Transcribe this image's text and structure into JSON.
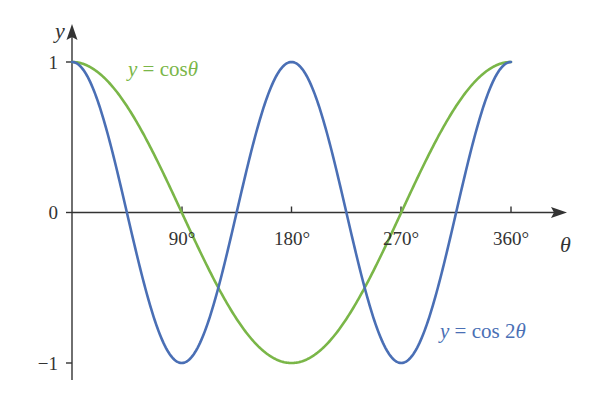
{
  "chart_data": {
    "type": "line",
    "title": "",
    "xlabel": "θ",
    "ylabel": "y",
    "xlim": [
      0,
      360
    ],
    "ylim": [
      -1,
      1
    ],
    "x_ticks": [
      90,
      180,
      270,
      360
    ],
    "x_tick_labels": [
      "90°",
      "180°",
      "270°",
      "360°"
    ],
    "y_ticks": [
      1,
      0,
      -1
    ],
    "y_tick_labels": [
      "1",
      "0",
      "−1"
    ],
    "grid": false,
    "series": [
      {
        "name": "y = cos θ",
        "function": "cos(theta)",
        "color": "#7ab648",
        "x": [
          0,
          45,
          90,
          135,
          180,
          225,
          270,
          315,
          360
        ],
        "values": [
          1,
          0.707,
          0,
          -0.707,
          -1,
          -0.707,
          0,
          0.707,
          1
        ]
      },
      {
        "name": "y = cos 2θ",
        "function": "cos(2*theta)",
        "color": "#4a6fb5",
        "x": [
          0,
          45,
          90,
          135,
          180,
          225,
          270,
          315,
          360
        ],
        "values": [
          1,
          0,
          -1,
          0,
          1,
          0,
          -1,
          0,
          1
        ]
      }
    ],
    "annotations": [
      {
        "text": "y = cos θ",
        "series": 0,
        "position": "upper-left"
      },
      {
        "text": "y = cos 2θ",
        "series": 1,
        "position": "lower-right"
      }
    ]
  },
  "labels": {
    "y_axis": "y",
    "x_axis": "θ",
    "cos_label_y": "y",
    "cos_label_eq": " = cos",
    "cos_label_theta": "θ",
    "cos2_label_y": "y",
    "cos2_label_eq": " = cos 2",
    "cos2_label_theta": "θ",
    "tick_90": "90°",
    "tick_180": "180°",
    "tick_270": "270°",
    "tick_360": "360°",
    "tick_y1": "1",
    "tick_y0": "0",
    "tick_ym1": "−1"
  }
}
